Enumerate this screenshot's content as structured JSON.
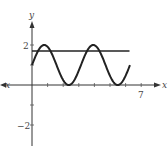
{
  "chart_data": {
    "type": "line",
    "title": "",
    "xlabel": "x",
    "ylabel": "y",
    "xlim": [
      -2,
      8.2
    ],
    "ylim": [
      -3,
      3.2
    ],
    "x_ticks": [
      1,
      2,
      3,
      4,
      5,
      6,
      7
    ],
    "x_tick_labels_shown": [
      "7"
    ],
    "y_ticks": [
      -2,
      -1,
      1,
      2
    ],
    "y_tick_labels_shown": [
      "2",
      "-2"
    ],
    "grid": false,
    "legend": null,
    "series": [
      {
        "name": "y = 1 + sin(2x)",
        "domain": [
          0,
          6.28
        ],
        "x": [
          0,
          0.785,
          1.571,
          2.356,
          3.142,
          3.927,
          4.712,
          5.498,
          6.283
        ],
        "values": [
          1,
          2,
          1,
          0,
          1,
          2,
          1,
          0,
          1
        ]
      },
      {
        "name": "horizontal line",
        "domain": [
          0,
          6.25
        ],
        "x": [
          0,
          6.25
        ],
        "values": [
          1.7,
          1.7
        ]
      }
    ]
  },
  "labels": {
    "x_axis": "x",
    "y_axis": "y",
    "y_tick_pos": "2",
    "y_tick_neg": "−2",
    "x_tick_7": "7"
  }
}
